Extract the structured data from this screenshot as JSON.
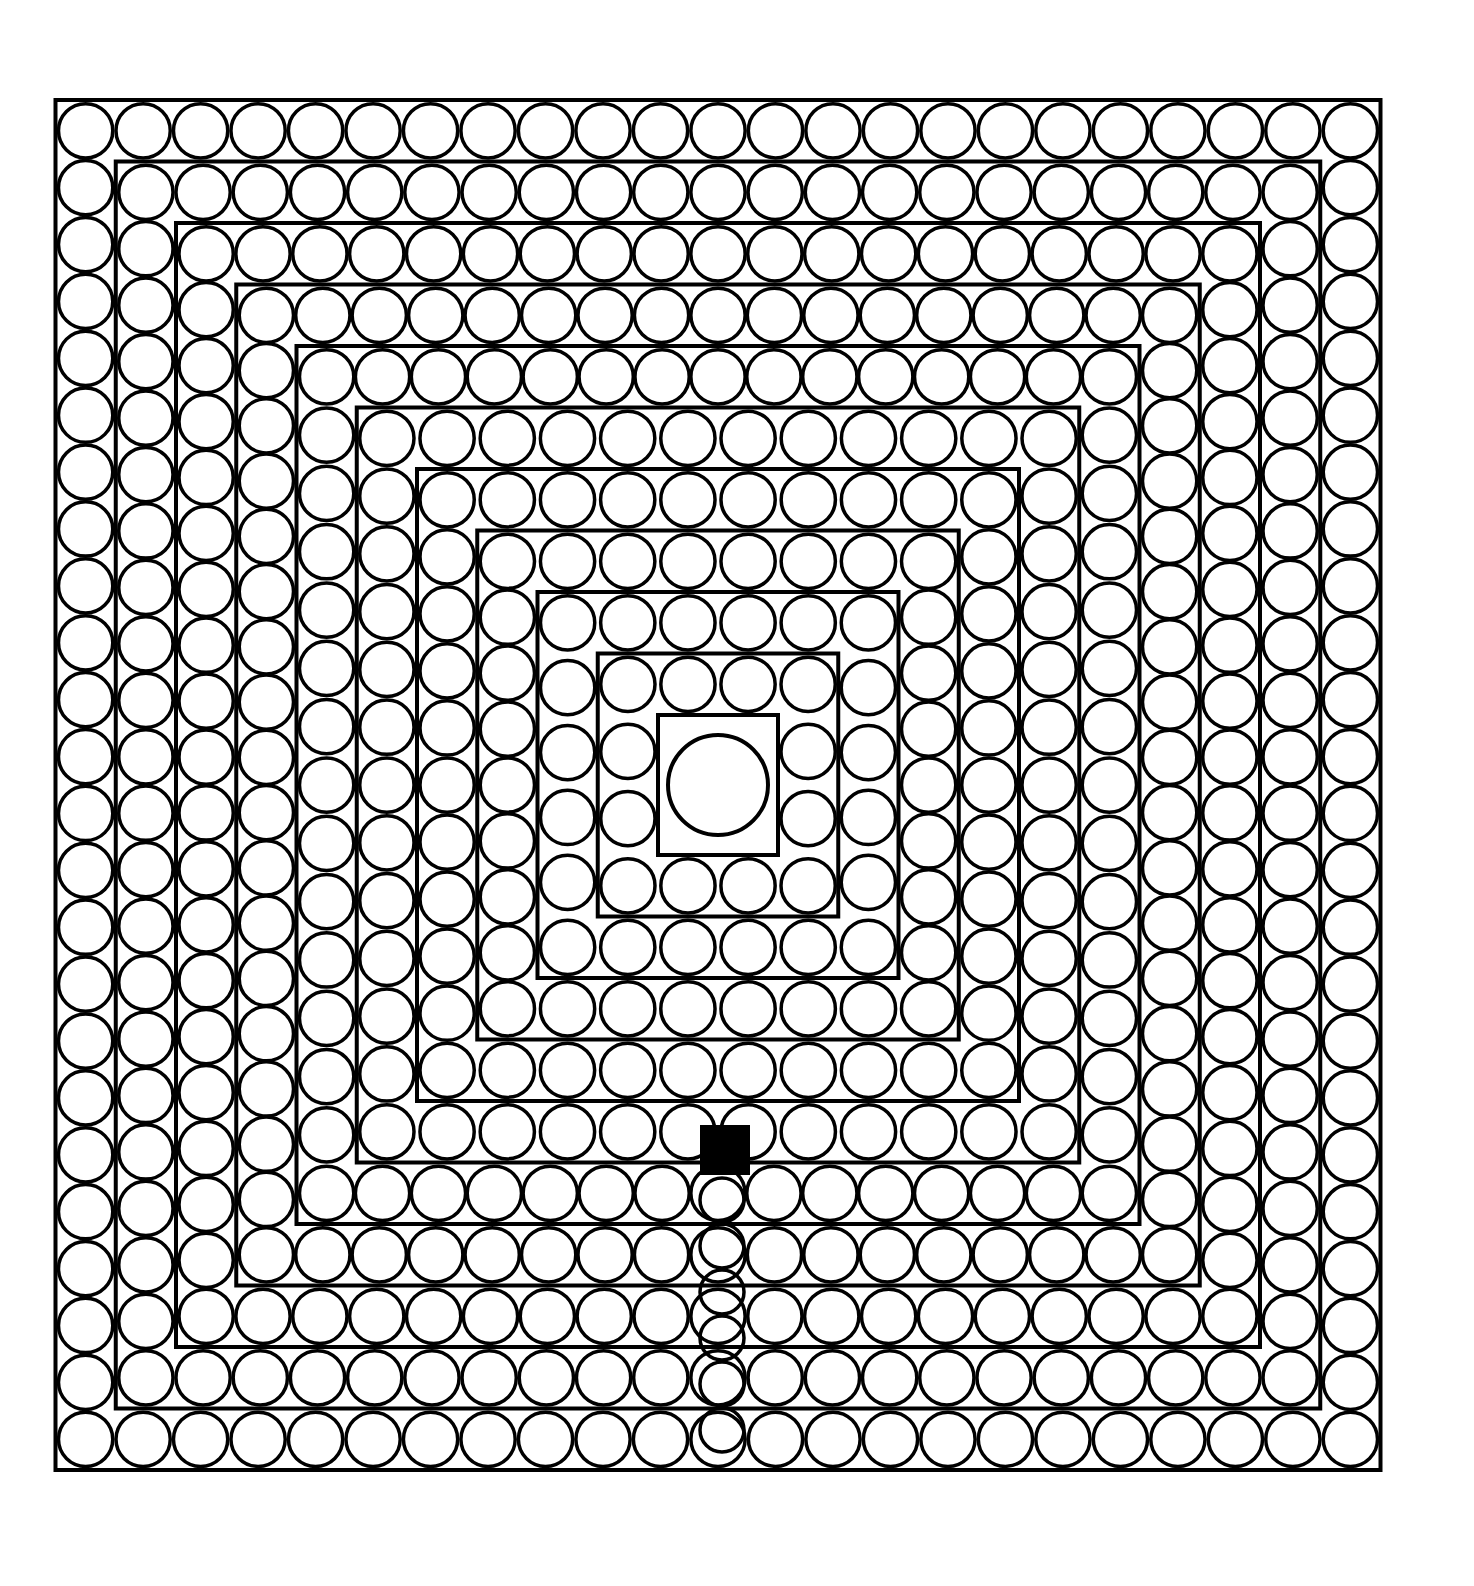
{
  "colors": {
    "ink": "#000000",
    "paper": "#ffffff"
  },
  "frame": {
    "x": 55,
    "y": 103,
    "w": 1325,
    "h": 1370
  },
  "center": {
    "cx": 718,
    "cy": 785,
    "r": 50
  },
  "entrance": {
    "x": 700,
    "y": 1125,
    "w": 50,
    "h": 50
  },
  "rings": 10
}
